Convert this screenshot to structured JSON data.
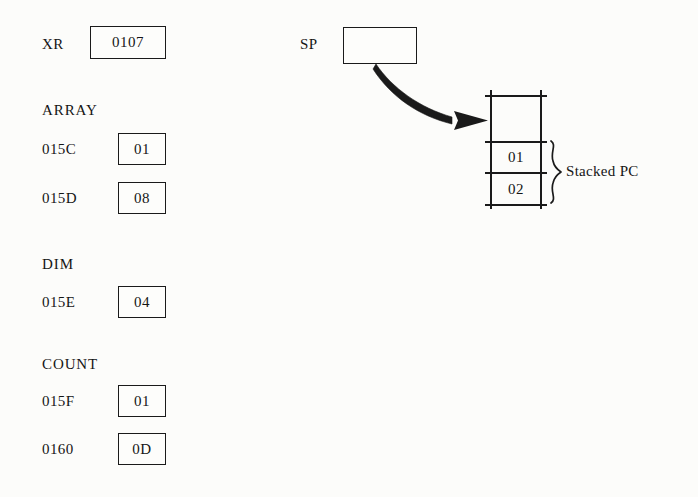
{
  "registers": [
    {
      "name": "XR",
      "value": "0107"
    }
  ],
  "memory_sections": [
    {
      "section_label": "ARRAY",
      "rows": [
        {
          "address": "015C",
          "value": "01"
        },
        {
          "address": "015D",
          "value": "08"
        }
      ]
    },
    {
      "section_label": "DIM",
      "rows": [
        {
          "address": "015E",
          "value": "04"
        }
      ]
    },
    {
      "section_label": "COUNT",
      "rows": [
        {
          "address": "015F",
          "value": "01"
        },
        {
          "address": "0160",
          "value": "0D"
        }
      ]
    }
  ],
  "stack_pointer": {
    "label": "SP",
    "value": ""
  },
  "stack": {
    "cells": [
      {
        "value": ""
      },
      {
        "value": "01"
      },
      {
        "value": "02"
      },
      {
        "value": ""
      }
    ],
    "annotation": "Stacked PC"
  },
  "colors": {
    "ink": "#1a1a1a",
    "paper": "#fcfcfa"
  }
}
